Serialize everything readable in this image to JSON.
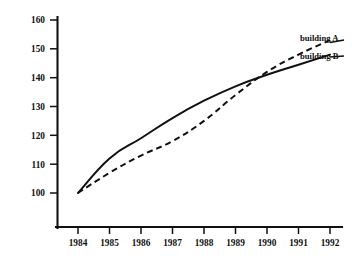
{
  "chart_data": {
    "type": "line",
    "title": "",
    "subtitle": "",
    "xlabel": "",
    "ylabel": "",
    "categories": [
      "1984",
      "1985",
      "1986",
      "1987",
      "1988",
      "1989",
      "1990",
      "1991",
      "1992"
    ],
    "x": [
      1984,
      1985,
      1986,
      1987,
      1988,
      1989,
      1990,
      1991,
      1992
    ],
    "xlim": [
      1984,
      1992
    ],
    "ylim": [
      95,
      162
    ],
    "yticks": [
      100,
      110,
      120,
      130,
      140,
      150,
      160
    ],
    "ytick_labels": [
      "100",
      "110",
      "120",
      "130",
      "140",
      "150",
      "160"
    ],
    "xtick_labels": [
      "1984",
      "1985",
      "1986",
      "1987",
      "1988",
      "1989",
      "1990",
      "1991",
      "1992"
    ],
    "grid": false,
    "legend_position": "right-inline-labels",
    "series": [
      {
        "name": "building A",
        "style": "dashed",
        "color": "#111111",
        "values": [
          100,
          107,
          113,
          118,
          125,
          134,
          142,
          148,
          153
        ]
      },
      {
        "name": "building B",
        "style": "solid",
        "color": "#111111",
        "values": [
          100,
          112,
          119,
          126,
          132,
          137,
          141,
          144.5,
          148
        ]
      }
    ],
    "annotations": [
      {
        "text": "building A",
        "anchor_series": "building A",
        "at_x": 1992
      },
      {
        "text": "building B",
        "anchor_series": "building B",
        "at_x": 1992
      }
    ]
  },
  "legend": {
    "building_a_label": "building A",
    "building_b_label": "building B"
  },
  "axes": {
    "y_labels": [
      "160",
      "150",
      "140",
      "130",
      "120",
      "110",
      "100"
    ],
    "x_labels": [
      "1984",
      "1985",
      "1986",
      "1987",
      "1988",
      "1989",
      "1990",
      "1991",
      "1992"
    ]
  },
  "colors": {
    "ink": "#111111",
    "background": "#ffffff"
  }
}
